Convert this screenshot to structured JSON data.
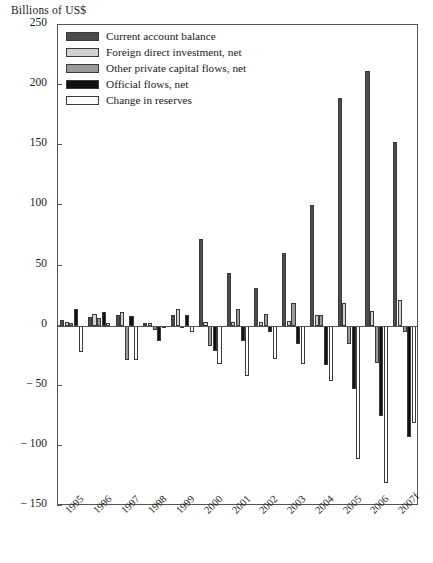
{
  "axis_title": "Billions of US$",
  "legend": {
    "items": [
      {
        "label": "Current account balance",
        "swatch": "dark-gray-swatch-icon",
        "color": "#4d4d4d"
      },
      {
        "label": "Foreign direct investment, net",
        "swatch": "light-gray-swatch-icon",
        "color": "#d2d2d2"
      },
      {
        "label": "Other private capital flows, net",
        "swatch": "medium-gray-swatch-icon",
        "color": "#9a9a9a"
      },
      {
        "label": "Official flows, net",
        "swatch": "black-swatch-icon",
        "color": "#111111"
      },
      {
        "label": "Change in reserves",
        "swatch": "white-swatch-icon",
        "color": "#ffffff"
      }
    ]
  },
  "chart_data": {
    "type": "bar",
    "title": "",
    "xlabel": "",
    "ylabel": "Billions of US$",
    "ylim": [
      -150,
      250
    ],
    "yticks": [
      250,
      200,
      150,
      100,
      50,
      0,
      -50,
      -100,
      -150
    ],
    "ytick_labels": [
      "250",
      "200",
      "150",
      "100",
      "50",
      "0",
      "− 50",
      "− 100",
      "− 150"
    ],
    "grid": false,
    "legend_position": "top-left",
    "categories": [
      "1995",
      "1996",
      "1997",
      "1998",
      "1999",
      "2000",
      "2001",
      "2002",
      "2003",
      "2004",
      "2005",
      "2006",
      "2007f"
    ],
    "series": [
      {
        "name": "Current account balance",
        "color": "#4d4d4d",
        "values": [
          5,
          7,
          9,
          2,
          9,
          72,
          44,
          31,
          60,
          100,
          189,
          212,
          153
        ]
      },
      {
        "name": "Foreign direct investment, net",
        "color": "#d2d2d2",
        "values": [
          3,
          10,
          11,
          2,
          14,
          3,
          3,
          3,
          4,
          9,
          19,
          12,
          21
        ]
      },
      {
        "name": "Other private capital flows, net",
        "color": "#9a9a9a",
        "values": [
          2,
          6,
          -29,
          -4,
          -2,
          -17,
          14,
          10,
          19,
          9,
          -15,
          -31,
          -5
        ]
      },
      {
        "name": "Official flows, net",
        "color": "#111111",
        "values": [
          14,
          11,
          8,
          -13,
          9,
          -21,
          -13,
          -5,
          -15,
          -33,
          -53,
          -75,
          -93
        ]
      },
      {
        "name": "Change in reserves",
        "color": "#ffffff",
        "values": [
          -22,
          2,
          -29,
          -2,
          -5,
          -32,
          -42,
          -28,
          -32,
          -46,
          -111,
          -131,
          -81
        ]
      }
    ]
  }
}
